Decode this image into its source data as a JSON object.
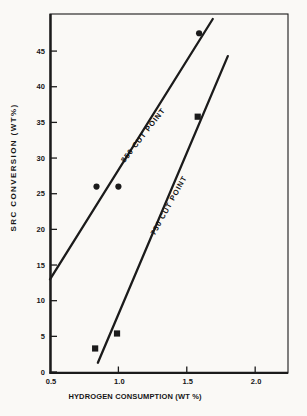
{
  "figure": {
    "background": "#faf9f6",
    "ink": "#1b1b1b"
  },
  "chart_data": {
    "type": "scatter",
    "title": "",
    "xlabel": "HYDROGEN CONSUMPTION (WT %)",
    "ylabel": "SRC CONVERSION (WT%)",
    "xlim": [
      0.5,
      2.24
    ],
    "ylim": [
      0,
      50.2
    ],
    "x_ticks": [
      0.5,
      1.0,
      1.5,
      2.0
    ],
    "x_tick_labels": [
      "0.5",
      "1.0",
      "1.5",
      "2.0"
    ],
    "y_ticks": [
      0,
      5,
      10,
      15,
      20,
      25,
      30,
      35,
      40,
      45
    ],
    "grid": false,
    "legend_position": "none (lines labeled inline)",
    "series": [
      {
        "name": "850 CUT POINT",
        "marker": "circle",
        "points": [
          {
            "x": 0.84,
            "y": 26
          },
          {
            "x": 1.0,
            "y": 26
          },
          {
            "x": 1.59,
            "y": 47.5
          }
        ],
        "fit_line": {
          "x1": 0.5,
          "y1": 13.0,
          "x2": 1.69,
          "y2": 49.5
        }
      },
      {
        "name": "750 CUT POINT",
        "marker": "square",
        "points": [
          {
            "x": 0.83,
            "y": 3.3
          },
          {
            "x": 0.99,
            "y": 5.4
          },
          {
            "x": 1.58,
            "y": 35.8
          }
        ],
        "fit_line": {
          "x1": 0.85,
          "y1": 1.3,
          "x2": 1.8,
          "y2": 44.3
        }
      }
    ],
    "annotations": [
      {
        "text": "850 CUT POINT",
        "x": 1.195,
        "y": 33.0,
        "rotation": -52
      },
      {
        "text": "750 CUT POINT",
        "x": 1.384,
        "y": 23.2,
        "rotation": -61
      }
    ]
  }
}
